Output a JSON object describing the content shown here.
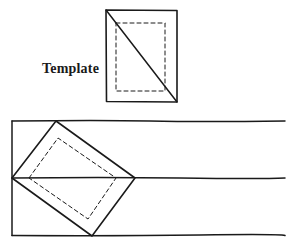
{
  "diagram": {
    "template_label": "Template",
    "colors": {
      "stroke": "#1a1a1a",
      "background": "#ffffff"
    },
    "template": {
      "outer_rect": {
        "x1": 106,
        "y1": 10,
        "x2": 177,
        "y2": 102
      },
      "inner_dashed_rect": {
        "x1": 116,
        "y1": 23,
        "x2": 165,
        "y2": 91
      },
      "diagonal": {
        "from": [
          106,
          10
        ],
        "to": [
          177,
          102
        ]
      }
    },
    "board": {
      "left_edge_x": 12,
      "right_end_x": 285,
      "lines_y": [
        121,
        178,
        235
      ],
      "rotated_template": [
        [
          12,
          178
        ],
        [
          56,
          121
        ],
        [
          135,
          178
        ],
        [
          92,
          236
        ]
      ],
      "rotated_dashed": [
        [
          29,
          178
        ],
        [
          58,
          138
        ],
        [
          116,
          178
        ],
        [
          88,
          219
        ]
      ]
    }
  }
}
